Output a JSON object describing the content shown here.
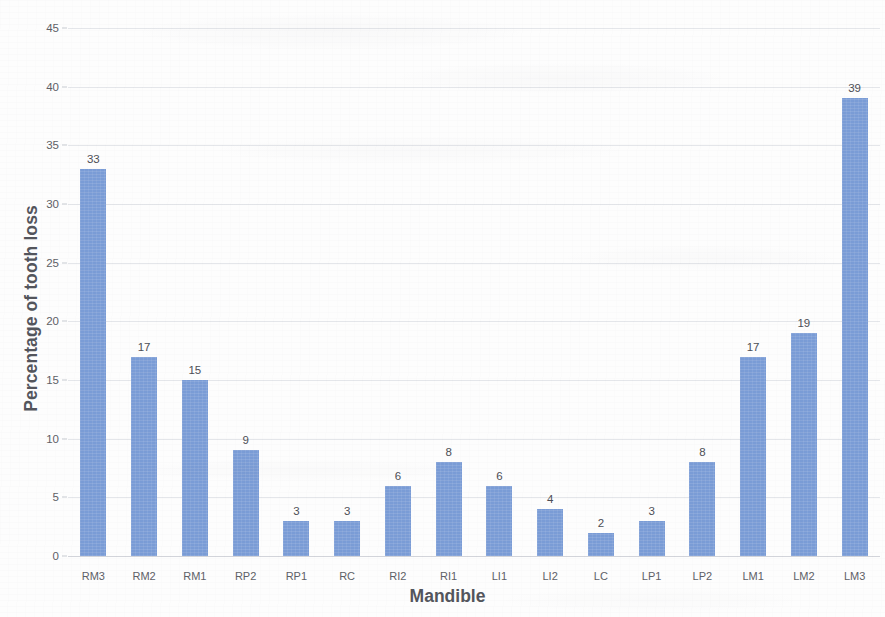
{
  "chart_data": {
    "type": "bar",
    "title": "",
    "xlabel": "Mandible",
    "ylabel": "Percentage of tooth loss",
    "categories": [
      "RM3",
      "RM2",
      "RM1",
      "RP2",
      "RP1",
      "RC",
      "RI2",
      "RI1",
      "LI1",
      "LI2",
      "LC",
      "LP1",
      "LP2",
      "LM1",
      "LM2",
      "LM3"
    ],
    "values": [
      33,
      17,
      15,
      9,
      3,
      3,
      6,
      8,
      6,
      4,
      2,
      3,
      8,
      17,
      19,
      39
    ],
    "value_labels": [
      "33",
      "17",
      "15",
      "9",
      "3",
      "3",
      "6",
      "8",
      "6",
      "4",
      "2",
      "3",
      "8",
      "17",
      "19",
      "39"
    ],
    "ylim": [
      0,
      45
    ],
    "ytick_step": 5,
    "ytick_labels": [
      "0",
      "5",
      "10",
      "15",
      "20",
      "25",
      "30",
      "35",
      "40",
      "45"
    ],
    "grid": true,
    "legend": false,
    "bar_color": "#7a9cd6",
    "axis_text_color": "#5e6066",
    "title_color": "#53555c",
    "background_color": "#fdfdfd"
  }
}
